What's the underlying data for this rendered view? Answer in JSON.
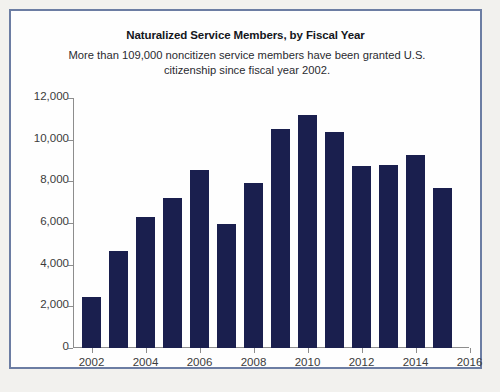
{
  "figure": {
    "title": "Naturalized Service Members, by Fiscal Year",
    "subtitle": "More than 109,000 noncitizen service members have been granted U.S. citizenship since fiscal year 2002.",
    "border_color": "#6c7da3",
    "background_color": "#fefefe",
    "page_background_color": "#f2f1ee"
  },
  "chart_data": {
    "type": "bar",
    "title": "Naturalized Service Members, by Fiscal Year",
    "subtitle": "More than 109,000 noncitizen service members have been granted U.S. citizenship since fiscal year 2002.",
    "xlabel": "",
    "ylabel": "",
    "bar_color": "#1a1f4e",
    "grid": false,
    "legend": false,
    "ylim": [
      0,
      12000
    ],
    "xlim": [
      2001.5,
      2016
    ],
    "ytick_labels": [
      "0",
      "2,000",
      "4,000",
      "6,000",
      "8,000",
      "10,000",
      "12,000"
    ],
    "ytick_values": [
      0,
      2000,
      4000,
      6000,
      8000,
      10000,
      12000
    ],
    "xtick_labels": [
      "2002",
      "2004",
      "2006",
      "2008",
      "2010",
      "2012",
      "2014",
      "2016"
    ],
    "xtick_values": [
      2002,
      2004,
      2006,
      2008,
      2010,
      2012,
      2014,
      2016
    ],
    "categories": [
      2002,
      2003,
      2004,
      2005,
      2006,
      2007,
      2008,
      2009,
      2010,
      2011,
      2012,
      2013,
      2014,
      2015
    ],
    "values": [
      2450,
      4650,
      6300,
      7200,
      8550,
      5950,
      7900,
      10500,
      11200,
      10350,
      8750,
      8800,
      9250,
      7700
    ]
  }
}
